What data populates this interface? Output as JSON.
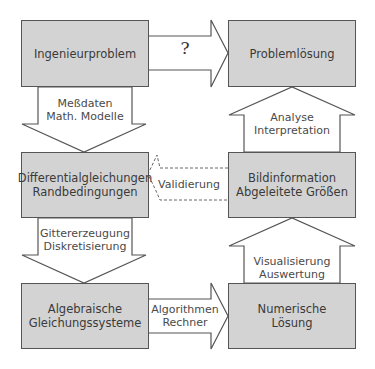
{
  "diagram": {
    "colors": {
      "box_fill": "#d3d3d3",
      "box_border": "#555555",
      "arrow_stroke": "#555555",
      "text": "#3a3a3a",
      "background": "#ffffff"
    },
    "boxes": {
      "ingenieurproblem": {
        "lines": [
          "Ingenieurproblem"
        ]
      },
      "problemloesung": {
        "lines": [
          "Problemlösung"
        ]
      },
      "differentialgleichungen": {
        "lines": [
          "Differentialgleichungen",
          "Randbedingungen"
        ]
      },
      "bildinformation": {
        "lines": [
          "Bildinformation",
          "Abgeleitete Größen"
        ]
      },
      "algebraische": {
        "lines": [
          "Algebraische",
          "Gleichungssysteme"
        ]
      },
      "numerische": {
        "lines": [
          "Numerische",
          "Lösung"
        ]
      }
    },
    "arrows": {
      "top_right": {
        "label": "?",
        "style": "solid",
        "direction": "right"
      },
      "left_down_1": {
        "lines": [
          "Meßdaten",
          "Math. Modelle"
        ],
        "style": "solid",
        "direction": "down"
      },
      "left_down_2": {
        "lines": [
          "Gittererzeugung",
          "Diskretisierung"
        ],
        "style": "solid",
        "direction": "down"
      },
      "bottom_right": {
        "lines": [
          "Algorithmen",
          "Rechner"
        ],
        "style": "solid",
        "direction": "right"
      },
      "right_up_1": {
        "lines": [
          "Visualisierung",
          "Auswertung"
        ],
        "style": "solid",
        "direction": "up"
      },
      "right_up_2": {
        "lines": [
          "Analyse",
          "Interpretation"
        ],
        "style": "solid",
        "direction": "up"
      },
      "middle_left": {
        "label": "Validierung",
        "style": "dashed",
        "direction": "left"
      }
    }
  }
}
